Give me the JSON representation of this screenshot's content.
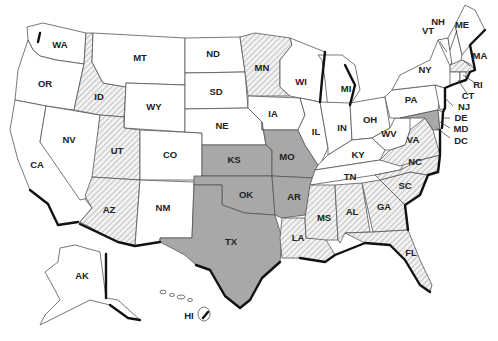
{
  "map": {
    "title": "",
    "legend_colors": {
      "plain": "#ffffff",
      "hatched": "#d8d8d8",
      "shaded": "#a8a8a8"
    },
    "states": [
      {
        "abbr": "WA",
        "fill": "plain"
      },
      {
        "abbr": "OR",
        "fill": "plain"
      },
      {
        "abbr": "CA",
        "fill": "plain"
      },
      {
        "abbr": "NV",
        "fill": "plain"
      },
      {
        "abbr": "ID",
        "fill": "hatched"
      },
      {
        "abbr": "MT",
        "fill": "plain"
      },
      {
        "abbr": "WY",
        "fill": "plain"
      },
      {
        "abbr": "UT",
        "fill": "hatched"
      },
      {
        "abbr": "AZ",
        "fill": "hatched"
      },
      {
        "abbr": "CO",
        "fill": "plain"
      },
      {
        "abbr": "NM",
        "fill": "plain"
      },
      {
        "abbr": "ND",
        "fill": "plain"
      },
      {
        "abbr": "SD",
        "fill": "plain"
      },
      {
        "abbr": "NE",
        "fill": "plain"
      },
      {
        "abbr": "KS",
        "fill": "shaded"
      },
      {
        "abbr": "OK",
        "fill": "shaded"
      },
      {
        "abbr": "TX",
        "fill": "shaded"
      },
      {
        "abbr": "MN",
        "fill": "hatched"
      },
      {
        "abbr": "IA",
        "fill": "plain"
      },
      {
        "abbr": "MO",
        "fill": "shaded"
      },
      {
        "abbr": "AR",
        "fill": "shaded"
      },
      {
        "abbr": "LA",
        "fill": "hatched"
      },
      {
        "abbr": "WI",
        "fill": "plain"
      },
      {
        "abbr": "IL",
        "fill": "plain"
      },
      {
        "abbr": "MI",
        "fill": "plain"
      },
      {
        "abbr": "IN",
        "fill": "plain"
      },
      {
        "abbr": "OH",
        "fill": "plain"
      },
      {
        "abbr": "KY",
        "fill": "plain"
      },
      {
        "abbr": "TN",
        "fill": "plain"
      },
      {
        "abbr": "MS",
        "fill": "hatched"
      },
      {
        "abbr": "AL",
        "fill": "hatched"
      },
      {
        "abbr": "GA",
        "fill": "hatched"
      },
      {
        "abbr": "FL",
        "fill": "hatched"
      },
      {
        "abbr": "SC",
        "fill": "hatched"
      },
      {
        "abbr": "NC",
        "fill": "hatched"
      },
      {
        "abbr": "VA",
        "fill": "hatched"
      },
      {
        "abbr": "WV",
        "fill": "plain"
      },
      {
        "abbr": "PA",
        "fill": "plain"
      },
      {
        "abbr": "NY",
        "fill": "plain"
      },
      {
        "abbr": "VT",
        "fill": "plain"
      },
      {
        "abbr": "NH",
        "fill": "plain"
      },
      {
        "abbr": "ME",
        "fill": "plain"
      },
      {
        "abbr": "MA",
        "fill": "hatched"
      },
      {
        "abbr": "RI",
        "fill": "plain"
      },
      {
        "abbr": "CT",
        "fill": "plain"
      },
      {
        "abbr": "NJ",
        "fill": "plain"
      },
      {
        "abbr": "DE",
        "fill": "plain"
      },
      {
        "abbr": "MD",
        "fill": "shaded"
      },
      {
        "abbr": "DC",
        "fill": "plain"
      },
      {
        "abbr": "AK",
        "fill": "plain"
      },
      {
        "abbr": "HI",
        "fill": "plain"
      }
    ],
    "labels": {
      "WA": "WA",
      "OR": "OR",
      "CA": "CA",
      "NV": "NV",
      "ID": "ID",
      "MT": "MT",
      "WY": "WY",
      "UT": "UT",
      "AZ": "AZ",
      "CO": "CO",
      "NM": "NM",
      "ND": "ND",
      "SD": "SD",
      "NE": "NE",
      "KS": "KS",
      "OK": "OK",
      "TX": "TX",
      "MN": "MN",
      "IA": "IA",
      "MO": "MO",
      "AR": "AR",
      "LA": "LA",
      "WI": "WI",
      "IL": "IL",
      "MI": "MI",
      "IN": "IN",
      "OH": "OH",
      "KY": "KY",
      "TN": "TN",
      "MS": "MS",
      "AL": "AL",
      "GA": "GA",
      "FL": "FL",
      "SC": "SC",
      "NC": "NC",
      "VA": "VA",
      "WV": "WV",
      "PA": "PA",
      "NY": "NY",
      "VT": "VT",
      "NH": "NH",
      "ME": "ME",
      "MA": "MA",
      "RI": "RI",
      "CT": "CT",
      "NJ": "NJ",
      "DE": "DE",
      "MD": "MD",
      "DC": "DC",
      "AK": "AK",
      "HI": "HI"
    }
  }
}
